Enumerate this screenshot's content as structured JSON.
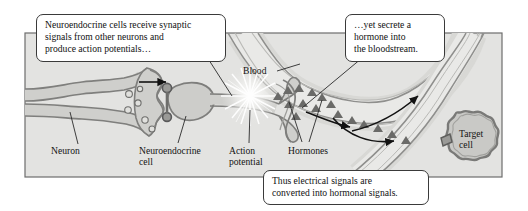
{
  "figure": {
    "domain": "biology-diagram",
    "topic": "Neuroendocrine signaling: electrical to hormonal conversion",
    "frame": {
      "x": 25,
      "y": 33,
      "width": 477,
      "height": 144,
      "background_color": "#e3e3e1",
      "border_color": "#6d6d6d"
    }
  },
  "callouts": [
    {
      "id": "callout-synaptic-input",
      "text": "Neuroendocrine cells receive synaptic\nsignals from other neurons and\nproduce action potentials…",
      "x": 36,
      "y": 14,
      "width": 190,
      "height": 45,
      "tail_to": {
        "x": 232,
        "y": 96
      }
    },
    {
      "id": "callout-secretion",
      "text": "…yet secrete a\nhormone into\nthe bloodstream.",
      "x": 345,
      "y": 14,
      "width": 100,
      "height": 45,
      "tail_to": {
        "x": 300,
        "y": 106
      }
    },
    {
      "id": "callout-conclusion",
      "text": "Thus electrical signals are\nconverted into hormonal signals.",
      "x": 263,
      "y": 170,
      "width": 166,
      "height": 33,
      "tail_to": null
    }
  ],
  "labels": [
    {
      "id": "label-neuron",
      "text": "Neuron",
      "x": 51,
      "y": 147,
      "leader": {
        "x1": 78,
        "y1": 146,
        "x2": 70,
        "y2": 112
      }
    },
    {
      "id": "label-neuroendocrine-cell",
      "text": "Neuroendocrine\ncell",
      "x": 139,
      "y": 147,
      "leader": {
        "x1": 178,
        "y1": 145,
        "x2": 186,
        "y2": 116
      }
    },
    {
      "id": "label-action-potential",
      "text": "Action\npotential",
      "x": 229,
      "y": 147,
      "leader": {
        "x1": 249,
        "y1": 145,
        "x2": 250,
        "y2": 110
      }
    },
    {
      "id": "label-hormones",
      "text": "Hormones",
      "x": 288,
      "y": 147,
      "leader": {
        "x1": 303,
        "y1": 144,
        "x2": 290,
        "y2": 104
      }
    },
    {
      "id": "label-hormones-2nd-leader",
      "text": "",
      "x": 0,
      "y": 0,
      "leader": {
        "x1": 310,
        "y1": 144,
        "x2": 321,
        "y2": 102
      }
    },
    {
      "id": "label-blood",
      "text": "Blood",
      "x": 243,
      "y": 66,
      "leader": {
        "x1": 277,
        "y1": 71,
        "x2": 300,
        "y2": 66
      }
    },
    {
      "id": "label-target-cell",
      "text": "Target\ncell",
      "x": 460,
      "y": 136
    }
  ],
  "anatomy": {
    "neuron": {
      "name": "presynaptic-neuron-axon",
      "membrane_color": "#8a8a88",
      "fill_color": "#cfcfcc",
      "vesicle_count": 6
    },
    "neuroendocrine_cell": {
      "name": "neuroendocrine-cell",
      "soma_fill": "#cdcdca",
      "membrane_color": "#7e7e7c"
    },
    "action_potential": {
      "name": "action-potential-starburst",
      "cx": 250,
      "cy": 96,
      "ray_count": 20,
      "color": "#ffffff"
    },
    "blood_vessel": {
      "name": "blood-vessel",
      "wall_color": "#8f8f8d",
      "lumen_color": "#e8e8e6"
    },
    "hormones": {
      "name": "hormone-particles",
      "glyph": "triangle",
      "color": "#6a6a68",
      "count": 16
    },
    "target_cell": {
      "name": "target-cell",
      "cx": 470,
      "cy": 143,
      "membrane_color": "#7a7a78",
      "fill_color": "#c9c9c6",
      "receptor": true
    },
    "flow_arrows": [
      {
        "name": "arrow-synaptic-direction",
        "from": [
          138,
          83
        ],
        "to": [
          165,
          83
        ]
      },
      {
        "name": "arrow-bloodstream-upper",
        "from": [
          355,
          131
        ],
        "to": [
          420,
          95
        ]
      },
      {
        "name": "arrow-hormone-to-target",
        "from": [
          335,
          118
        ],
        "to": [
          395,
          140
        ]
      },
      {
        "name": "arrow-vessel-flow",
        "from": [
          310,
          113
        ],
        "to": [
          352,
          126
        ]
      }
    ]
  }
}
